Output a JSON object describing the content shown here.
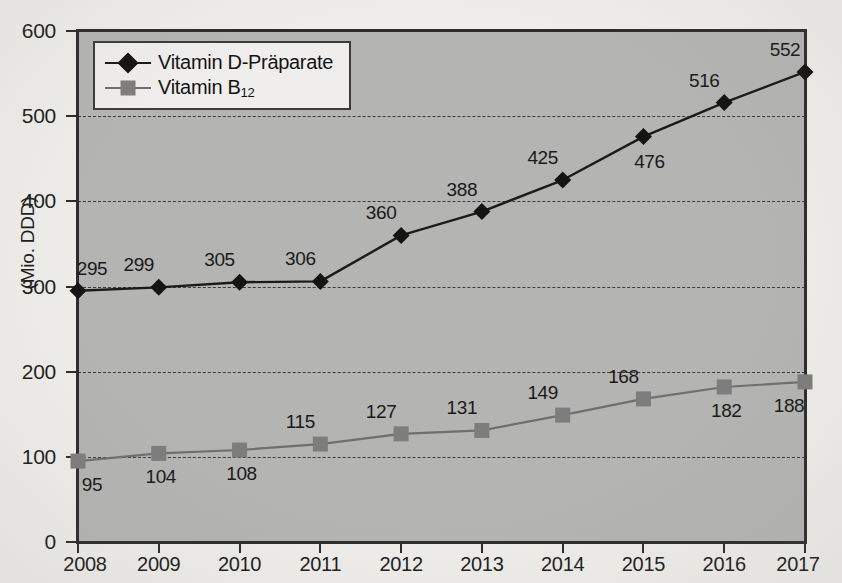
{
  "chart_data": {
    "type": "line",
    "title": "",
    "xlabel": "",
    "ylabel": "(Mio. DDD)",
    "categories": [
      "2008",
      "2009",
      "2010",
      "2011",
      "2012",
      "2013",
      "2014",
      "2015",
      "2016",
      "2017"
    ],
    "ylim": [
      0,
      600
    ],
    "yticks": [
      0,
      100,
      200,
      300,
      400,
      500,
      600
    ],
    "ytick_labels": [
      "0",
      "100",
      "200",
      "300",
      "400",
      "500",
      "600"
    ],
    "gridlines_at": [
      100,
      200,
      300,
      400,
      500
    ],
    "grid": true,
    "grid_style": "dashed",
    "legend_position": "top-left-inside",
    "plot_background": "#b4b4b2",
    "page_background": "#efedea",
    "series": [
      {
        "name": "Vitamin D-Präparate",
        "marker": "diamond",
        "color": "#141414",
        "line_color": "#1b1b1b",
        "values": [
          295,
          299,
          305,
          306,
          360,
          388,
          425,
          476,
          516,
          552
        ],
        "label_positions": [
          "above",
          "above",
          "above",
          "above",
          "above",
          "above",
          "above",
          "below-right",
          "above",
          "above"
        ]
      },
      {
        "name": "Vitamin B12",
        "name_base": "Vitamin B",
        "name_sub": "12",
        "marker": "square",
        "color": "#7d7d7d",
        "line_color": "#6f6f6f",
        "values": [
          95,
          104,
          108,
          115,
          127,
          131,
          149,
          168,
          182,
          188
        ],
        "label_positions": [
          "below",
          "below",
          "below",
          "above",
          "above",
          "above",
          "above",
          "above",
          "below",
          "below"
        ]
      }
    ]
  },
  "legend": {
    "items": [
      {
        "label": "Vitamin D-Präparate"
      },
      {
        "label_base": "Vitamin B",
        "label_sub": "12"
      }
    ]
  }
}
